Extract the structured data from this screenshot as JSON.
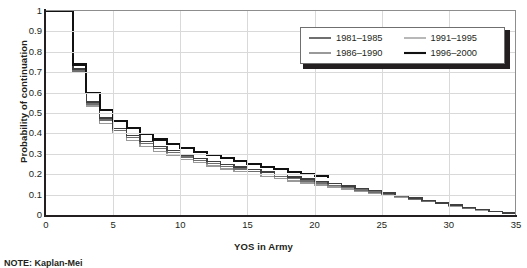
{
  "chart_data": {
    "type": "line",
    "subtype": "step",
    "title": "",
    "xlabel": "YOS in Army",
    "ylabel": "Probability of continuation",
    "xlim": [
      0,
      35
    ],
    "ylim": [
      0,
      1
    ],
    "xticks": [
      0,
      5,
      10,
      15,
      20,
      25,
      30,
      35
    ],
    "yticks": [
      0,
      0.1,
      0.2,
      0.3,
      0.4,
      0.5,
      0.6,
      0.7,
      0.8,
      0.9,
      1
    ],
    "grid": true,
    "legend_position": "top-right",
    "x": [
      0,
      1,
      2,
      3,
      4,
      5,
      6,
      7,
      8,
      9,
      10,
      11,
      12,
      13,
      14,
      15,
      16,
      17,
      18,
      19,
      20,
      21,
      22,
      23,
      24,
      25,
      26,
      27,
      28,
      29,
      30,
      31,
      32,
      33,
      34,
      35
    ],
    "series": [
      {
        "name": "1981–1985",
        "color": "#3f3f3f",
        "width": 1.5,
        "values": [
          1,
          1,
          0.715,
          0.555,
          0.475,
          0.425,
          0.39,
          0.36,
          0.335,
          0.315,
          0.295,
          0.278,
          0.262,
          0.248,
          0.235,
          0.222,
          0.21,
          0.198,
          0.187,
          0.176,
          0.165,
          0.154,
          0.143,
          0.131,
          0.12,
          0.108,
          0.096,
          0.084,
          0.072,
          0.06,
          0.048,
          0.037,
          0.027,
          0.018,
          0.011,
          0.006
        ]
      },
      {
        "name": "1986–1990",
        "color": "#6e6e6e",
        "width": 1.4,
        "values": [
          1,
          1,
          0.705,
          0.545,
          0.465,
          0.415,
          0.38,
          0.35,
          0.325,
          0.305,
          0.285,
          0.268,
          0.252,
          0.238,
          0.225,
          0.212,
          0.2,
          0.189,
          0.178,
          0.167,
          0.156,
          0.145,
          0.134,
          0.123,
          0.112,
          0.101,
          0.09,
          0.079,
          0.068,
          0.057,
          0.046,
          0.035,
          0.026,
          0.017,
          0.01,
          0.005
        ]
      },
      {
        "name": "1991–1995",
        "color": "#9a9a9a",
        "width": 1.4,
        "values": [
          1,
          1,
          0.7,
          0.535,
          0.45,
          0.4,
          0.365,
          0.335,
          0.312,
          0.292,
          0.273,
          0.256,
          0.24,
          0.226,
          0.213,
          0.2,
          0.189,
          0.178,
          0.167,
          0.157,
          0.147,
          0.137,
          0.127,
          0.117,
          0.107,
          0.097,
          0.086,
          0.076,
          0.065,
          0.055,
          0.044,
          0.034,
          0.025,
          0.016,
          0.01,
          0.005
        ]
      },
      {
        "name": "1996–2000",
        "color": "#111111",
        "width": 2.1,
        "values": [
          1,
          1,
          0.738,
          0.6,
          0.515,
          0.462,
          0.425,
          0.395,
          0.37,
          0.348,
          0.328,
          0.31,
          0.293,
          0.278,
          0.264,
          0.25,
          0.237,
          0.225,
          0.213,
          0.202,
          0.191,
          0.18,
          null,
          null,
          null,
          null,
          null,
          null,
          null,
          null,
          null,
          null,
          null,
          null,
          null,
          null
        ]
      }
    ]
  },
  "axes": {
    "y_title": "Probability of continuation",
    "x_title": "YOS in Army",
    "y_tick_labels": [
      "1",
      "0.9",
      "0.8",
      "0.7",
      "0.6",
      "0.5",
      "0.4",
      "0.3",
      "0.2",
      "0.1",
      "0"
    ],
    "x_tick_labels": [
      "0",
      "5",
      "10",
      "15",
      "20",
      "25",
      "30",
      "35"
    ]
  },
  "legend": {
    "items": [
      {
        "label": "1981–1985"
      },
      {
        "label": "1986–1990"
      },
      {
        "label": "1991–1995"
      },
      {
        "label": "1996–2000"
      }
    ]
  },
  "note": {
    "text": "NOTE: Kaplan-Mei"
  }
}
